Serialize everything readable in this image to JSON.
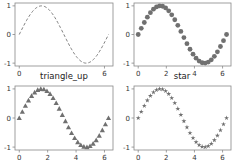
{
  "figure": {
    "width": 234,
    "height": 163,
    "layout": "2x2 subplots",
    "background": "#ffffff"
  },
  "chart_data": [
    {
      "type": "line",
      "position": "top-left",
      "title": "",
      "series": [
        {
          "name": "sin(x)",
          "style": "dashed",
          "color": "#808080"
        }
      ],
      "x": {
        "function": "x from 0 to 2π"
      },
      "y": {
        "function": "sin(x)"
      },
      "xlim": [
        -0.3,
        6.6
      ],
      "ylim": [
        -1.1,
        1.1
      ],
      "xticks": [
        0,
        6
      ],
      "xtick_labels": [
        "0",
        "6"
      ],
      "yticks": [
        -1,
        0,
        1
      ],
      "ytick_labels": [
        "-1",
        "0",
        "1"
      ]
    },
    {
      "type": "scatter",
      "position": "top-right",
      "title": "",
      "marker": "circle",
      "series": [
        {
          "name": "sin(x)",
          "color": "#707070",
          "points": 30
        }
      ],
      "xlim": [
        -0.3,
        6.6
      ],
      "ylim": [
        -1.1,
        1.1
      ],
      "xticks": [
        0,
        2,
        4,
        6
      ],
      "xtick_labels": [
        "0",
        "2",
        "4",
        "6"
      ],
      "yticks": [
        -1,
        0,
        1
      ],
      "ytick_labels": [
        "-1",
        "0",
        "1"
      ]
    },
    {
      "type": "scatter",
      "position": "bottom-left",
      "title": "triangle_up",
      "marker": "triangle_up",
      "series": [
        {
          "name": "sin(x)",
          "color": "#707070",
          "points": 30
        }
      ],
      "xlim": [
        -0.3,
        6.6
      ],
      "ylim": [
        -1.1,
        1.1
      ],
      "xticks": [
        0,
        2,
        4,
        6
      ],
      "xtick_labels": [
        "0",
        "2",
        "4",
        "6"
      ],
      "yticks": [
        -1,
        0,
        1
      ],
      "ytick_labels": [
        "-1",
        "0",
        "1"
      ]
    },
    {
      "type": "scatter",
      "position": "bottom-right",
      "title": "star",
      "marker": "star",
      "series": [
        {
          "name": "sin(x)",
          "color": "#707070",
          "points": 30
        }
      ],
      "xlim": [
        -0.3,
        6.6
      ],
      "ylim": [
        -1.1,
        1.1
      ],
      "xticks": [
        0,
        2,
        4,
        6
      ],
      "xtick_labels": [
        "0",
        "2",
        "4",
        "6"
      ],
      "yticks": [
        -1,
        0,
        1
      ],
      "ytick_labels": [
        "-1",
        "0",
        "1"
      ]
    }
  ],
  "titles": {
    "bottom_left": "triangle_up",
    "bottom_right": "star"
  },
  "colors": {
    "line": "#808080",
    "marker": "#6e6e6e",
    "frame": "#888888",
    "text": "#333333"
  }
}
